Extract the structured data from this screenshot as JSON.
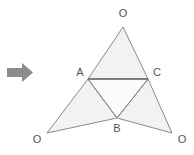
{
  "figure": {
    "background_color": "#ffffff",
    "fill_color": "#f2f2f2",
    "stroke_color": "#8a8a8a",
    "highlight_stroke_color": "#6e6e6e",
    "label_color": "#555555",
    "arrow": {
      "icon": "arrow-right-icon",
      "color": "#8c8c8c",
      "shaft": {
        "x": 7,
        "y": 68,
        "width": 16,
        "height": 9
      },
      "head": {
        "points": "22,63 33,72.5 22,82"
      }
    },
    "points": {
      "A": {
        "x": 88,
        "y": 79,
        "label": "A",
        "label_x": 80,
        "label_y": 73
      },
      "B": {
        "x": 117,
        "y": 118,
        "label": "B",
        "label_x": 117,
        "label_y": 129
      },
      "C": {
        "x": 148,
        "y": 79,
        "label": "C",
        "label_x": 157,
        "label_y": 73
      },
      "O_top": {
        "x": 123,
        "y": 27,
        "label": "O",
        "label_x": 123,
        "label_y": 14
      },
      "O_left": {
        "x": 47,
        "y": 133,
        "label": "O",
        "label_x": 37,
        "label_y": 140
      },
      "O_right": {
        "x": 172,
        "y": 133,
        "label": "O",
        "label_x": 182,
        "label_y": 140
      }
    },
    "shapes": [
      {
        "name": "top-triangle",
        "points": "123,27 88,79 148,79"
      },
      {
        "name": "left-triangle",
        "points": "88,79 47,133 117,118"
      },
      {
        "name": "right-triangle",
        "points": "148,79 172,133 117,118"
      },
      {
        "name": "center-triangle",
        "points": "88,79 148,79 117,118"
      }
    ],
    "segments": [
      {
        "name": "segment-AC",
        "x1": 88,
        "y1": 79,
        "x2": 148,
        "y2": 79,
        "highlight": true
      },
      {
        "name": "segment-AB",
        "x1": 88,
        "y1": 79,
        "x2": 117,
        "y2": 118,
        "highlight": false
      },
      {
        "name": "segment-BC",
        "x1": 117,
        "y1": 118,
        "x2": 148,
        "y2": 79,
        "highlight": false
      }
    ],
    "labels": [
      "O",
      "A",
      "C",
      "O",
      "B",
      "O"
    ]
  }
}
